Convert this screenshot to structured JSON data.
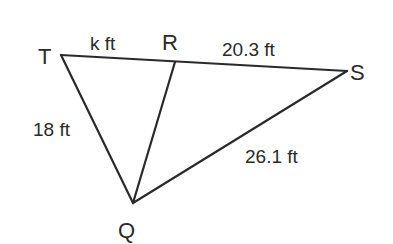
{
  "diagram": {
    "type": "triangle-with-cevian",
    "vertices": [
      {
        "id": "T",
        "label": "T"
      },
      {
        "id": "R",
        "label": "R"
      },
      {
        "id": "S",
        "label": "S"
      },
      {
        "id": "Q",
        "label": "Q"
      }
    ],
    "segments": [
      {
        "from": "T",
        "to": "R",
        "length_label": "k ft"
      },
      {
        "from": "R",
        "to": "S",
        "length_label": "20.3 ft"
      },
      {
        "from": "T",
        "to": "Q",
        "length_label": "18 ft"
      },
      {
        "from": "S",
        "to": "Q",
        "length_label": "26.1 ft"
      },
      {
        "from": "R",
        "to": "Q",
        "length_label": ""
      }
    ],
    "colors": {
      "line": "#2a2a2a",
      "background": "#ffffff"
    }
  }
}
